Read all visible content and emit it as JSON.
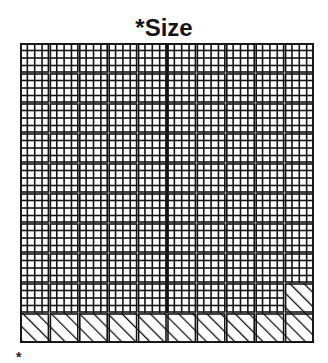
{
  "header": {
    "title": "*Size"
  },
  "footnote": {
    "marker": "*"
  },
  "grid": {
    "rows": 10,
    "cols": 10,
    "subdivisions": 4,
    "hatched_cells": [
      [
        9,
        0
      ],
      [
        9,
        1
      ],
      [
        9,
        2
      ],
      [
        9,
        3
      ],
      [
        9,
        4
      ],
      [
        9,
        5
      ],
      [
        9,
        6
      ],
      [
        9,
        7
      ],
      [
        9,
        8
      ],
      [
        9,
        9
      ],
      [
        8,
        9
      ]
    ],
    "thick_vertical_col": 5,
    "line_color": "#141414",
    "background_color": "#ffffff"
  }
}
